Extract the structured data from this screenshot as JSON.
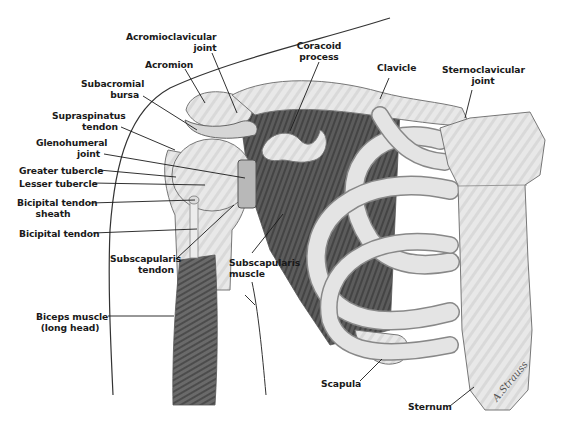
{
  "diagram": {
    "type": "anatomical-illustration",
    "signature": "A.Strauss",
    "labels": {
      "acromioclavicular_joint": [
        "Acromioclavicular",
        "joint"
      ],
      "acromion": [
        "Acromion"
      ],
      "subacromial_bursa": [
        "Subacromial",
        "bursa"
      ],
      "supraspinatus_tendon": [
        "Supraspinatus",
        "tendon"
      ],
      "glenohumeral_joint": [
        "Glenohumeral",
        "joint"
      ],
      "greater_tubercle": [
        "Greater tubercle"
      ],
      "lesser_tubercle": [
        "Lesser tubercle"
      ],
      "bicipital_tendon_sheath": [
        "Bicipital tendon",
        "sheath"
      ],
      "bicipital_tendon": [
        "Bicipital tendon"
      ],
      "subscapularis_tendon": [
        "Subscapularis",
        "tendon"
      ],
      "subscapularis_muscle": [
        "Subscapularis",
        "muscle"
      ],
      "biceps_muscle": [
        "Biceps muscle",
        "(long head)"
      ],
      "coracoid_process": [
        "Coracoid",
        "process"
      ],
      "clavicle": [
        "Clavicle"
      ],
      "sternoclavicular_joint": [
        "Sternoclavicular",
        "joint"
      ],
      "scapula": [
        "Scapula"
      ],
      "sternum": [
        "Sternum"
      ]
    },
    "colors": {
      "bone": "#e6e6e6",
      "bone_shade": "#c8c8c8",
      "muscle": "#5a5a5a",
      "outline": "#6e6e6e",
      "leader_line": "#1a1a1a",
      "text": "#1a1a1a"
    }
  }
}
